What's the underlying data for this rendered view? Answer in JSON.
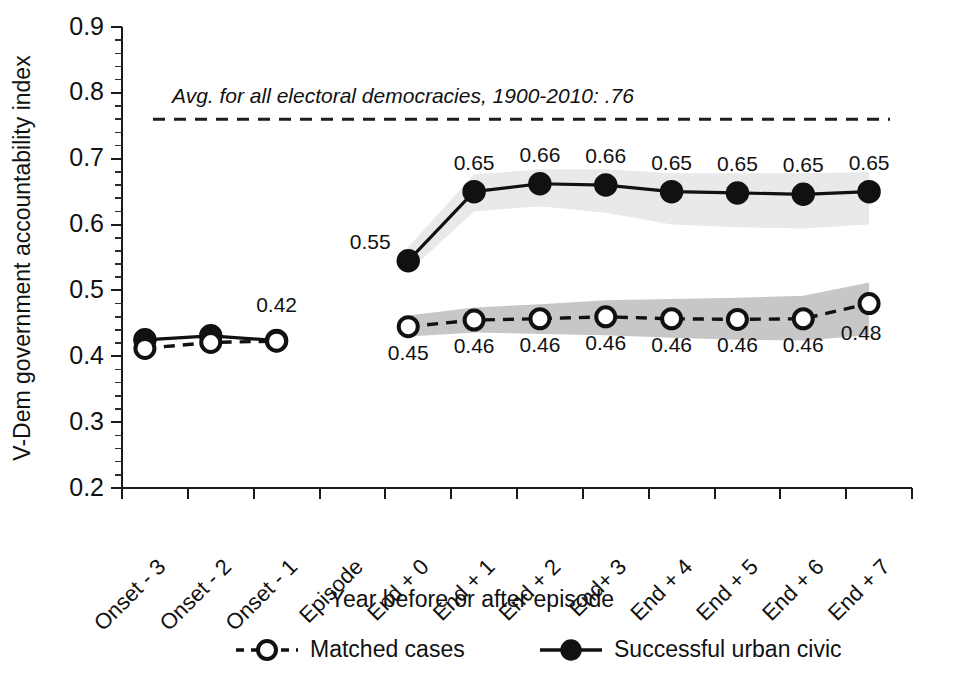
{
  "chart_data": {
    "type": "line",
    "title": "",
    "xlabel": "Year before or after episode",
    "ylabel": "V-Dem government accountability index",
    "ylim": [
      0.2,
      0.9
    ],
    "ytick_labels": [
      "0.9",
      "0.8",
      "0.7",
      "0.6",
      "0.5",
      "0.4",
      "0.3",
      "0.2"
    ],
    "ytick_values": [
      0.9,
      0.8,
      0.7,
      0.6,
      0.5,
      0.4,
      0.3,
      0.2
    ],
    "grid": false,
    "legend_position": "bottom",
    "categories": [
      "Onset - 3",
      "Onset - 2",
      "Onset - 1",
      "Episode",
      "End + 0",
      "End + 1",
      "End + 2",
      "End+ 3",
      "End + 4",
      "End + 5",
      "End + 6",
      "End + 7"
    ],
    "series": [
      {
        "name": "Matched cases",
        "marker": "open-circle",
        "line": "dashed",
        "values": [
          0.412,
          0.421,
          0.423,
          null,
          0.445,
          0.455,
          0.457,
          0.46,
          0.457,
          0.456,
          0.457,
          0.48
        ],
        "labels": [
          null,
          null,
          null,
          null,
          "0.45",
          "0.46",
          "0.46",
          "0.46",
          "0.46",
          "0.46",
          "0.46",
          "0.48"
        ],
        "label_position": "below",
        "band_low": [
          0.412,
          0.421,
          0.423,
          null,
          0.43,
          0.436,
          0.434,
          0.432,
          0.428,
          0.425,
          0.424,
          0.432
        ],
        "band_high": [
          0.412,
          0.421,
          0.423,
          null,
          0.462,
          0.474,
          0.479,
          0.485,
          0.487,
          0.489,
          0.492,
          0.512
        ]
      },
      {
        "name": "Successful urban  civic",
        "marker": "filled-circle",
        "line": "solid",
        "values": [
          0.425,
          0.431,
          0.424,
          null,
          0.545,
          0.65,
          0.662,
          0.66,
          0.65,
          0.648,
          0.646,
          0.65
        ],
        "labels": [
          null,
          null,
          "0.42",
          null,
          "0.55",
          "0.65",
          "0.66",
          "0.66",
          "0.65",
          "0.65",
          "0.65",
          "0.65"
        ],
        "label_position": "above",
        "band_low": [
          0.425,
          0.431,
          0.424,
          null,
          0.528,
          0.62,
          0.628,
          0.618,
          0.6,
          0.596,
          0.594,
          0.6
        ],
        "band_high": [
          0.425,
          0.431,
          0.424,
          null,
          0.566,
          0.676,
          0.684,
          0.684,
          0.678,
          0.678,
          0.678,
          0.68
        ]
      }
    ],
    "reference_line": {
      "value": 0.76,
      "style": "dashed",
      "note": "Avg. for all electoral democracies, 1900-2010: .76"
    },
    "colors": {
      "line": "#111111",
      "band_successful": "#e9e9e9",
      "band_matched": "#c7c7c7",
      "axis": "#1a1a1a",
      "text": "#111111"
    }
  },
  "legend": {
    "items": [
      {
        "label": "Matched cases",
        "marker": "open-circle",
        "line": "dashed"
      },
      {
        "label": "Successful urban  civic",
        "marker": "filled-circle",
        "line": "solid"
      }
    ]
  }
}
